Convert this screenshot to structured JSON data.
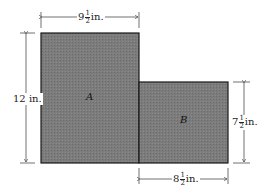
{
  "regions": [
    {
      "name": "A"
    },
    {
      "name": "B"
    }
  ],
  "dimensions": {
    "top": {
      "whole": "9",
      "num": "1",
      "den": "2",
      "unit": "in."
    },
    "left": {
      "whole": "12",
      "unit": "in."
    },
    "right": {
      "whole": "7",
      "num": "1",
      "den": "2",
      "unit": "in."
    },
    "bottom": {
      "whole": "8",
      "num": "1",
      "den": "2",
      "unit": "in."
    }
  },
  "colors": {
    "fill": "#7a7a7a",
    "stroke": "#1a1a1a"
  }
}
